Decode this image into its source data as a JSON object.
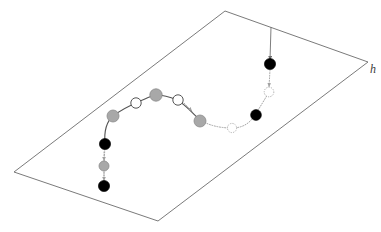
{
  "figure": {
    "background_color": "#ffffff",
    "width": 381,
    "height": 232,
    "labels": {
      "plane_label": "h"
    },
    "colors": {
      "plane_edge": "#6b6b6b",
      "solid_path": "#555555",
      "dotted_path": "#9a9a9a",
      "node_black": "#000000",
      "node_gray": "#a8a8a8",
      "node_white_fill": "#ffffff",
      "node_white_stroke": "#555555",
      "label_color": "#3a3a3a"
    },
    "plane": {
      "name": "parallelogram-plane",
      "points": "225,11 368,62 158,221 14,172",
      "corners": [
        {
          "name": "top",
          "x": 225,
          "y": 11
        },
        {
          "name": "right",
          "x": 368,
          "y": 62
        },
        {
          "name": "bottom",
          "x": 158,
          "y": 221
        },
        {
          "name": "left",
          "x": 14,
          "y": 172
        }
      ]
    },
    "paths": [
      {
        "name": "main-arc-solid",
        "style": "solid",
        "d": "M 105,144 C 104,132 106,122 113,116 C 122,109 131,105 140,101 C 150,97 153,95 156,95 C 162,95 170,97 177,100 C 185,104 191,112 200,120"
      },
      {
        "name": "main-arc-dotted",
        "style": "dotted",
        "d": "M 200,120 C 210,126 221,128 232,128 C 243,128 250,123 255,115"
      },
      {
        "name": "right-riser-dotted",
        "style": "dotted",
        "d": "M 255,115 C 260,107 265,99 269,92"
      },
      {
        "name": "left-descender-dotted",
        "style": "dotted",
        "d": "M 105,144 L 104,166 L 104,186"
      }
    ],
    "arrows": [
      {
        "name": "top-incoming-arrow",
        "style": "solid",
        "from": {
          "x": 271,
          "y": 27
        },
        "to": {
          "x": 270,
          "y": 60
        }
      },
      {
        "name": "right-node-drop-arrow",
        "style": "faint",
        "from": {
          "x": 270,
          "y": 70
        },
        "to": {
          "x": 269,
          "y": 87
        }
      },
      {
        "name": "left-chain-arrow-upper",
        "style": "faint",
        "from": {
          "x": 104,
          "y": 152
        },
        "to": {
          "x": 104,
          "y": 161
        }
      },
      {
        "name": "left-chain-arrow-lower",
        "style": "faint",
        "from": {
          "x": 104,
          "y": 172
        },
        "to": {
          "x": 104,
          "y": 181
        }
      },
      {
        "name": "mid-arc-arrow",
        "style": "faint",
        "from": {
          "x": 184,
          "y": 103
        },
        "to": {
          "x": 192,
          "y": 111
        }
      }
    ],
    "nodes": [
      {
        "name": "node-arc-gray-1",
        "x": 113,
        "y": 116,
        "r": 6.0,
        "kind": "gray"
      },
      {
        "name": "node-arc-white-1",
        "x": 136,
        "y": 103,
        "r": 5.2,
        "kind": "white"
      },
      {
        "name": "node-arc-gray-2",
        "x": 156,
        "y": 95,
        "r": 6.2,
        "kind": "gray"
      },
      {
        "name": "node-arc-white-2",
        "x": 178,
        "y": 100,
        "r": 5.2,
        "kind": "white"
      },
      {
        "name": "node-arc-gray-3",
        "x": 200,
        "y": 121,
        "r": 6.0,
        "kind": "gray"
      },
      {
        "name": "node-arc-white-3",
        "x": 232,
        "y": 128,
        "r": 4.6,
        "kind": "white-faint"
      },
      {
        "name": "node-right-black-1",
        "x": 256,
        "y": 115,
        "r": 5.4,
        "kind": "black"
      },
      {
        "name": "node-right-white-1",
        "x": 269,
        "y": 92,
        "r": 4.8,
        "kind": "white-faint"
      },
      {
        "name": "node-top-black",
        "x": 270,
        "y": 64,
        "r": 5.6,
        "kind": "black"
      },
      {
        "name": "node-left-black-1",
        "x": 105,
        "y": 144,
        "r": 5.6,
        "kind": "black"
      },
      {
        "name": "node-left-gray-1",
        "x": 104,
        "y": 166,
        "r": 5.0,
        "kind": "gray"
      },
      {
        "name": "node-left-black-2",
        "x": 104,
        "y": 186,
        "r": 5.6,
        "kind": "black"
      }
    ],
    "label_positions": {
      "plane_label": {
        "x": 370,
        "y": 73
      }
    }
  }
}
